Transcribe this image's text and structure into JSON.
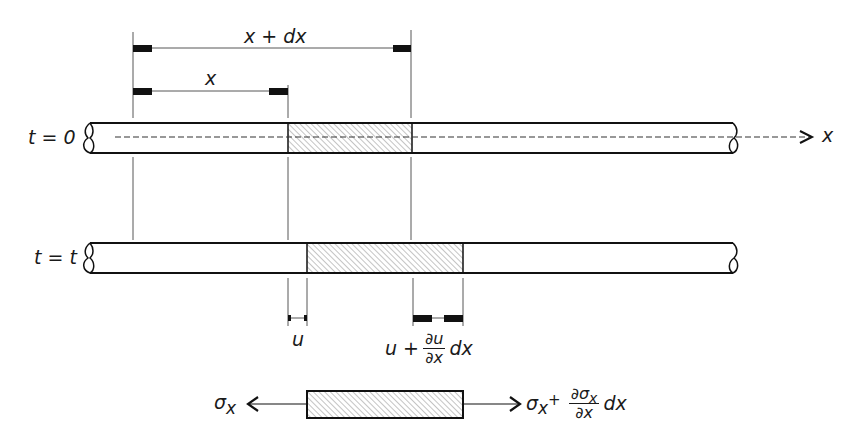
{
  "figure": {
    "type": "elastic bar element displacement diagram",
    "colors": {
      "line": "#1a1a1a",
      "hatch": "#777777",
      "background": "#ffffff"
    }
  },
  "dimensions": {
    "x_plus_dx": {
      "label": "x + dx"
    },
    "x": {
      "label": "x"
    },
    "u": {
      "label": "u"
    },
    "u_plus": {
      "lhs": "u +",
      "num": "∂u",
      "den": "∂x",
      "tail": "dx"
    }
  },
  "bars": {
    "t0": {
      "label": "t = 0"
    },
    "tt": {
      "label": "t = t"
    }
  },
  "axis": {
    "label": "x"
  },
  "stress_element": {
    "left": {
      "sym": "σ",
      "sub": "x"
    },
    "right": {
      "sym": "σ",
      "sub": "x",
      "plus": "+",
      "num_sym": "∂σ",
      "num_sub": "x",
      "den": "∂x",
      "tail": "dx"
    }
  }
}
